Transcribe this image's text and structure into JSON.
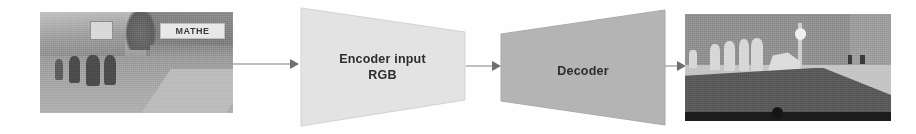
{
  "diagram": {
    "background_color": "#ffffff",
    "nodes": {
      "input_image": {
        "name": "Input RGB street scene photograph",
        "description": "Grayscale urban street photo with pedestrians, buildings and a shop banner",
        "sign_text": "MATHE",
        "x": 40,
        "y": 12,
        "width": 193,
        "height": 101
      },
      "encoder": {
        "label_line1": "Encoder input",
        "label_line2": "RGB",
        "shape": "trapezoid-narrowing-right",
        "fill_color": "#e3e3e3",
        "text_color": "#2d2d2d",
        "x": 299,
        "y": 6,
        "width": 167,
        "height": 122
      },
      "decoder": {
        "label_line1": "Decoder",
        "shape": "trapezoid-widening-right",
        "fill_color": "#b4b4b4",
        "text_color": "#2d2d2d",
        "x": 500,
        "y": 6,
        "width": 166,
        "height": 122
      },
      "output_image": {
        "name": "Output semantic segmentation map",
        "description": "Flat-shaded class map: sky, road, sidewalk, pedestrians, pole and lamp",
        "x": 685,
        "y": 14,
        "width": 206,
        "height": 107
      }
    },
    "arrows": [
      {
        "id": "input-to-encoder",
        "from": "input_image",
        "to": "encoder",
        "color": "#808080"
      },
      {
        "id": "encoder-to-decoder",
        "from": "encoder",
        "to": "decoder",
        "color": "#808080"
      },
      {
        "id": "decoder-to-output",
        "from": "decoder",
        "to": "output_image",
        "color": "#808080"
      }
    ]
  }
}
